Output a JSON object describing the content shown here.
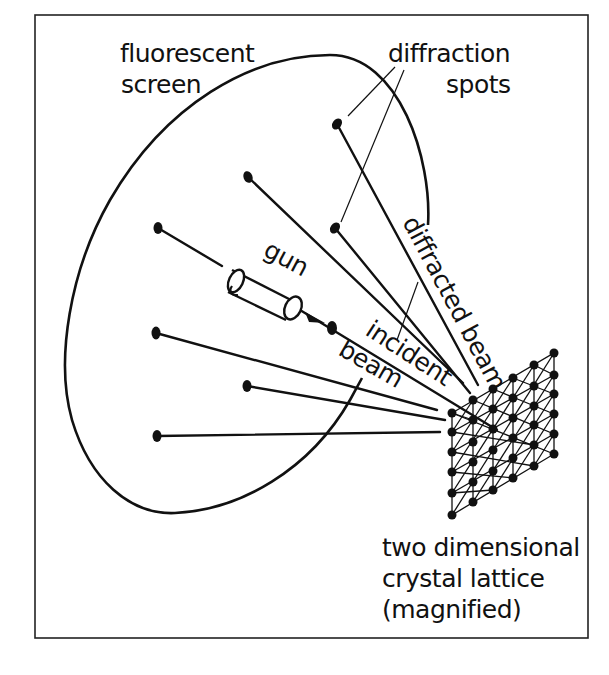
{
  "labels": {
    "screen_line1": "fluorescent",
    "screen_line2": "screen",
    "spots_line1": "diffraction",
    "spots_line2": "spots",
    "gun": "gun",
    "diffracted_beam": "diffracted beam",
    "incident": "incident",
    "beam": "beam",
    "lattice_line1": "two dimensional",
    "lattice_line2": "crystal lattice",
    "lattice_line3": "(magnified)"
  },
  "diagram": {
    "type": "LEED experiment schematic",
    "diffraction_spots": [
      {
        "x": 337,
        "y": 124
      },
      {
        "x": 248,
        "y": 177
      },
      {
        "x": 158,
        "y": 228
      },
      {
        "x": 335,
        "y": 228
      },
      {
        "x": 156,
        "y": 333
      },
      {
        "x": 247,
        "y": 386
      },
      {
        "x": 157,
        "y": 436
      }
    ],
    "lattice_columns": 6,
    "lattice_rows": 6,
    "colors": {
      "ink": "#111111",
      "background": "#ffffff"
    }
  }
}
